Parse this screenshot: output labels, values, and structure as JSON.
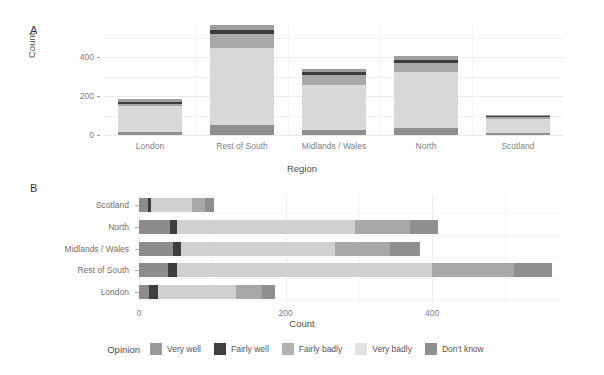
{
  "panels": {
    "a_tag": "A",
    "b_tag": "B"
  },
  "legend": {
    "title": "Opinion",
    "position": "bottom"
  },
  "chart_data": [
    {
      "id": "panel-a",
      "type": "bar",
      "orientation": "vertical",
      "stacked": true,
      "title": "",
      "xlabel": "Region",
      "ylabel": "Count",
      "categories": [
        "London",
        "Rest of South",
        "Midlands / Wales",
        "North",
        "Scotland"
      ],
      "yticks": [
        0,
        200,
        400
      ],
      "ylim": [
        0,
        580
      ],
      "grid": true,
      "legend_title": "Opinion",
      "series": [
        {
          "name": "Very well",
          "color": "#9e9e9e",
          "values": [
            14,
            26,
            16,
            20,
            6
          ]
        },
        {
          "name": "Fairly well",
          "color": "#3d3d3d",
          "values": [
            12,
            22,
            14,
            17,
            5
          ]
        },
        {
          "name": "Fairly badly",
          "color": "#a8a8a8",
          "values": [
            9,
            72,
            52,
            45,
            10
          ]
        },
        {
          "name": "Very badly",
          "color": "#d9d9d9",
          "values": [
            136,
            396,
            232,
            288,
            74
          ]
        },
        {
          "name": "Don't know",
          "color": "#8f8f8f",
          "values": [
            14,
            49,
            26,
            35,
            10
          ]
        }
      ],
      "totals": [
        185,
        565,
        340,
        405,
        105
      ]
    },
    {
      "id": "panel-b",
      "type": "bar",
      "orientation": "horizontal",
      "stacked": true,
      "title": "",
      "xlabel": "Count",
      "ylabel": "",
      "categories": [
        "London",
        "Rest of South",
        "Midlands / Wales",
        "North",
        "Scotland"
      ],
      "category_order_top_to_bottom": [
        "Scotland",
        "North",
        "Midlands / Wales",
        "Rest of South",
        "London"
      ],
      "xticks": [
        0,
        200,
        400
      ],
      "xlim": [
        0,
        580
      ],
      "grid": true,
      "legend_title": "Opinion",
      "series": [
        {
          "name": "Very well",
          "color": "#8c8c8c",
          "values": [
            14,
            40,
            47,
            42,
            12
          ]
        },
        {
          "name": "Fairly well",
          "color": "#3d3d3d",
          "values": [
            12,
            12,
            10,
            10,
            4
          ]
        },
        {
          "name": "Fairly badly",
          "color": "#d0d0d0",
          "values": [
            106,
            348,
            210,
            243,
            56
          ]
        },
        {
          "name": "Very badly",
          "color": "#a8a8a8",
          "values": [
            36,
            112,
            76,
            75,
            18
          ]
        },
        {
          "name": "Don't know",
          "color": "#8f8f8f",
          "values": [
            17,
            52,
            40,
            38,
            12
          ]
        }
      ],
      "totals": [
        185,
        564,
        383,
        408,
        102
      ]
    }
  ],
  "opinion_categories": [
    {
      "label": "Very well",
      "color": "#9a9a9a"
    },
    {
      "label": "Fairly well",
      "color": "#3f3f3f"
    },
    {
      "label": "Fairly badly",
      "color": "#b3b3b3"
    },
    {
      "label": "Very badly",
      "color": "#e2e2e2"
    },
    {
      "label": "Don't know",
      "color": "#8f8f8f"
    }
  ],
  "axis_a": {
    "ylabel": "Count",
    "xlabel": "Region",
    "ytick_labels": [
      "0",
      "200",
      "400"
    ],
    "xtick_labels": [
      "London",
      "Rest of South",
      "Midlands / Wales",
      "North",
      "Scotland"
    ]
  },
  "axis_b": {
    "xlabel": "Count",
    "xtick_labels": [
      "0",
      "200",
      "400"
    ],
    "ytick_labels": [
      "Scotland",
      "North",
      "Midlands / Wales",
      "Rest of South",
      "London"
    ]
  }
}
